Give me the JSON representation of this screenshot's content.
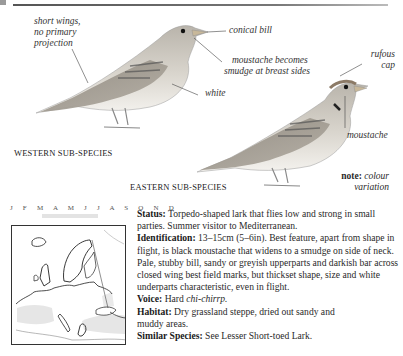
{
  "page": {
    "top_rule": true
  },
  "illustration": {
    "western": {
      "caption": "WESTERN SUB-SPECIES",
      "annotations": {
        "wings": [
          "short wings,",
          "no primary",
          "projection"
        ],
        "bill": "conical bill",
        "moustache": [
          "moustache becomes",
          "smudge at breast sides"
        ],
        "belly": "white"
      }
    },
    "eastern": {
      "caption": "EASTERN SUB-SPECIES",
      "annotations": {
        "cap": [
          "rufous",
          "cap"
        ],
        "moustache": "moustache"
      },
      "note_label": "note:",
      "note_text": [
        "colour",
        "variation"
      ]
    }
  },
  "calendar": {
    "months": "J F M A M J J A S O N D",
    "present_months": [
      "A",
      "M",
      "J",
      "J",
      "A",
      "S"
    ]
  },
  "map": {
    "region": "Europe",
    "legend": "range map"
  },
  "description": {
    "status_label": "Status:",
    "status_text": "Torpedo-shaped lark that flies low and strong in small parties. Summer visitor to Mediterranean.",
    "identification_label": "Identification:",
    "identification_text": "13–15cm (5–6in). Best feature, apart from shape in flight, is black moustache that widens to a smudge on side of neck. Pale, stubby bill, sandy or greyish upperparts and darkish bar across closed wing best field marks, but thickset shape, size and white underparts characteristic, even in flight.",
    "voice_label": "Voice:",
    "voice_text_pre": "Hard ",
    "voice_call": "chi-chirrp.",
    "habitat_label": "Habitat:",
    "habitat_text": "Dry grassland steppe, dried out sandy and muddy areas.",
    "similar_label": "Similar Species:",
    "similar_text": "See Lesser Short-toed Lark."
  }
}
